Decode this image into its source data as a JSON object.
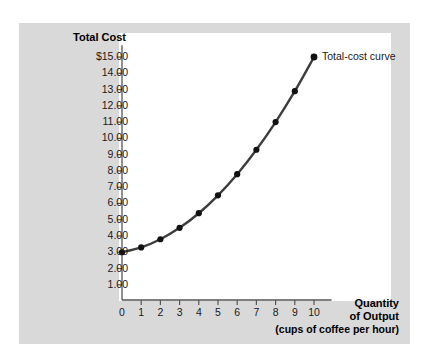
{
  "chart_data": {
    "type": "line",
    "title": "",
    "ylabel": "Total Cost",
    "xlabel": "Quantity of Output",
    "xlabel_line1": "Quantity",
    "xlabel_line2": "of Output",
    "xlabel_sub": "(cups of coffee per hour)",
    "x": [
      0,
      1,
      2,
      3,
      4,
      5,
      6,
      7,
      8,
      9,
      10
    ],
    "values": [
      3.0,
      3.3,
      3.8,
      4.5,
      5.4,
      6.5,
      7.8,
      9.3,
      11.0,
      12.9,
      15.0
    ],
    "series": [
      {
        "name": "Total-cost curve",
        "values": [
          3.0,
          3.3,
          3.8,
          4.5,
          5.4,
          6.5,
          7.8,
          9.3,
          11.0,
          12.9,
          15.0
        ]
      }
    ],
    "annotations": [
      {
        "text": "Total-cost curve",
        "x": 10,
        "y": 15.0
      }
    ],
    "xlim": [
      0,
      10.6
    ],
    "ylim": [
      0,
      15.6
    ],
    "grid": false,
    "legend": false,
    "markers": true,
    "xticks": [
      "0",
      "1",
      "2",
      "3",
      "4",
      "5",
      "6",
      "7",
      "8",
      "9",
      "10"
    ],
    "xtick_values": [
      0,
      1,
      2,
      3,
      4,
      5,
      6,
      7,
      8,
      9,
      10
    ],
    "yticks": [
      "1.00",
      "2.00",
      "3.00",
      "4.00",
      "5.00",
      "6.00",
      "7.00",
      "8.00",
      "9.00",
      "10.00",
      "11.00",
      "12.00",
      "13.00",
      "14.00",
      "$15.00"
    ],
    "ytick_values": [
      1,
      2,
      3,
      4,
      5,
      6,
      7,
      8,
      9,
      10,
      11,
      12,
      13,
      14,
      15
    ],
    "colors": {
      "curve": "#3d3d3d",
      "marker": "#111111",
      "axis": "#555555",
      "panel_background": "#d9d9d9",
      "plot_background": "#ffffff",
      "text": "#1a1a1a"
    }
  }
}
